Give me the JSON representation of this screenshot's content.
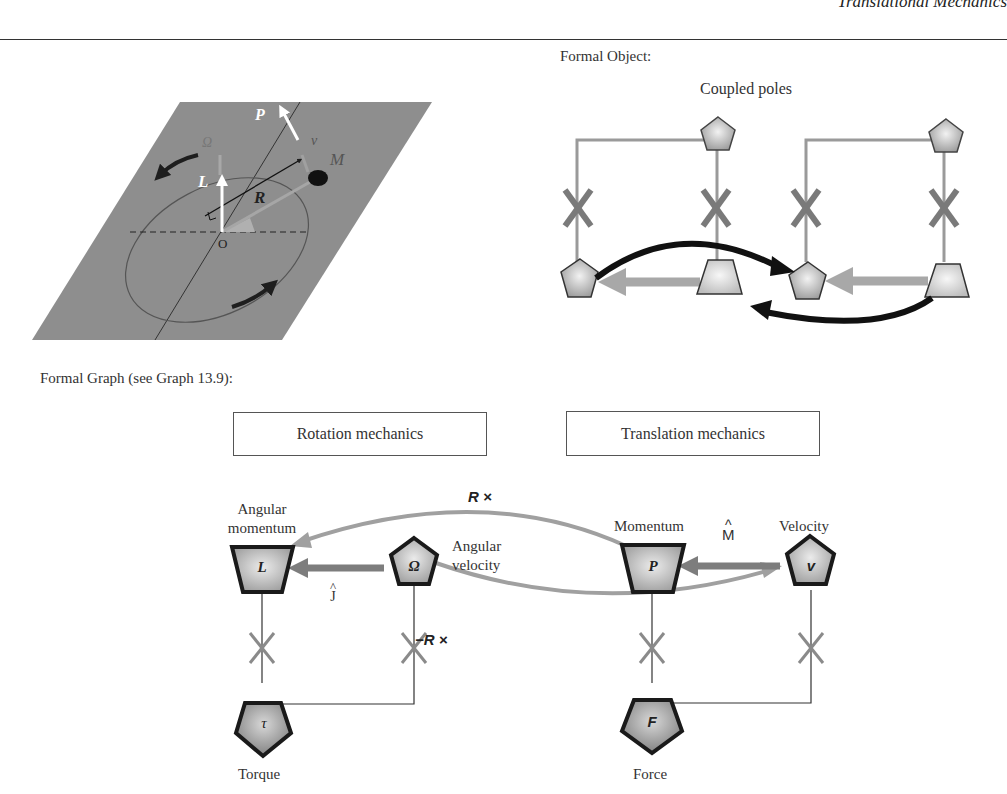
{
  "page": {
    "running_head": "Translational Mechanics",
    "formal_object_caption": "Formal Object:",
    "formal_graph_caption": "Formal Graph (see Graph 13.9):"
  },
  "physical_figure": {
    "labels": {
      "P": "P",
      "v": "v",
      "Omega": "Ω",
      "M": "M",
      "L": "L",
      "R": "R",
      "O": "O"
    },
    "colors": {
      "plane": "#8c8c8c",
      "ellipse": "#555555",
      "vectors": "#ffffff",
      "arrows": "#1e1e1e"
    }
  },
  "formal_object": {
    "title": "Coupled poles",
    "colors": {
      "connector": "#9a9a9a",
      "cross": "#7a7a7a",
      "coupling_arrow": "#111111",
      "pole_fill": "#c8c8c8",
      "inner_arrow": "#a8a8a8"
    }
  },
  "formal_graph": {
    "boxes": {
      "rotation": "Rotation mechanics",
      "translation": "Translation mechanics"
    },
    "nodes": {
      "L": {
        "symbol": "L",
        "label_line1": "Angular",
        "label_line2": "momentum",
        "shape": "trapezoid"
      },
      "Omega": {
        "symbol": "Ω",
        "label_line1": "Angular",
        "label_line2": "velocity",
        "shape": "pentagon"
      },
      "P": {
        "symbol": "P",
        "label": "Momentum",
        "shape": "trapezoid"
      },
      "v": {
        "symbol": "v",
        "label": "Velocity",
        "shape": "pentagon"
      },
      "tau": {
        "symbol": "τ",
        "label": "Torque",
        "shape": "pentagon"
      },
      "F": {
        "symbol": "F",
        "label": "Force",
        "shape": "pentagon"
      }
    },
    "operators": {
      "upper_coupling": "R ×",
      "lower_coupling": "−R ×",
      "inertia_rotation": "Ĵ",
      "mass_translation": "M̂",
      "hat": "^",
      "J": "J",
      "M": "M"
    },
    "colors": {
      "node_fill": "#b8b8b8",
      "node_stroke": "#1a1a1a",
      "coupling_arc": "#a0a0a0",
      "inner_arrow": "#7d7d7d",
      "cross": "#8a8a8a"
    }
  }
}
